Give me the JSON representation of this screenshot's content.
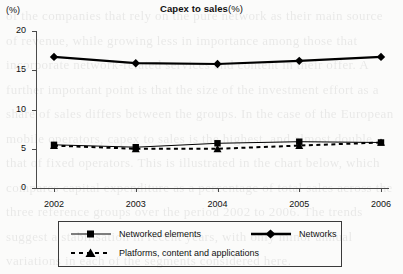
{
  "page": {
    "background_bleed_text": "of the companies that rely on the pure network as their main source of revenue, while growing less in importance among those that incorporate network-related services and content in their offer. A further important point is that the size of the investment effort as a share of sales differs between the groups. In the case of the European mobile operators, capex to sales is the highest, and almost double that of fixed operators. This is illustrated in the chart below, which compares capital expenditure as a percentage of total sales across the three reference groups over the period 2002 to 2006. The trends suggest a stabilisation in recent years, with only minor annual variations in each of the segments considered here."
  },
  "chart_data": {
    "type": "line",
    "title": "Capex to sales",
    "title_bold": "Capex to sales",
    "title_unit": "(%)",
    "axis_unit_label": "(%)",
    "xlabel": "",
    "ylabel": "",
    "categories": [
      "2002",
      "2003",
      "2004",
      "2005",
      "2006"
    ],
    "ylim": [
      0,
      20
    ],
    "yticks": [
      0,
      5,
      10,
      15,
      20
    ],
    "ytick_labels": [
      "0",
      "5",
      "10",
      "15",
      "20"
    ],
    "grid": false,
    "legend_position": "bottom",
    "series": [
      {
        "name": "Networked elements",
        "marker": "square",
        "line_style": "solid",
        "line_width": 1,
        "color": "#000000",
        "values": [
          5.5,
          5.2,
          5.7,
          5.9,
          5.8
        ]
      },
      {
        "name": "Networks",
        "marker": "diamond",
        "line_style": "solid",
        "line_width": 2.2,
        "color": "#000000",
        "values": [
          16.7,
          15.9,
          15.8,
          16.2,
          16.7
        ]
      },
      {
        "name": "Platforms, content and applications",
        "marker": "triangle",
        "line_style": "dashed",
        "line_width": 2,
        "color": "#000000",
        "values": [
          5.4,
          5.0,
          5.0,
          5.4,
          5.8
        ]
      }
    ]
  },
  "legend": {
    "entries": [
      {
        "label": "Networked elements"
      },
      {
        "label": "Networks"
      },
      {
        "label": "Platforms, content and applications"
      }
    ]
  }
}
